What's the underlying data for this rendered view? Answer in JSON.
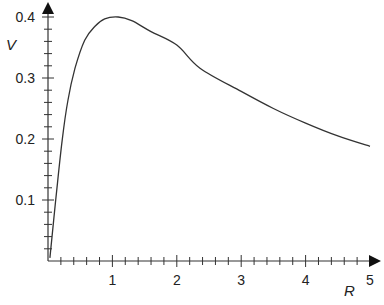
{
  "chart_data": {
    "type": "line",
    "title": "",
    "xlabel": "R",
    "ylabel": "V",
    "xlim": [
      0,
      5
    ],
    "ylim": [
      0,
      0.4
    ],
    "grid": false,
    "legend": null,
    "x_ticks": [
      1,
      2,
      3,
      4,
      5
    ],
    "x_tick_labels": [
      "1",
      "2",
      "3",
      "4",
      "5"
    ],
    "x_minor_step": 0.2,
    "y_ticks": [
      0.1,
      0.2,
      0.3,
      0.4
    ],
    "y_tick_labels": [
      "0.1",
      "0.2",
      "0.3",
      "0.4"
    ],
    "y_minor_step": 0.02,
    "series": [
      {
        "name": "V(R)",
        "color": "#333333",
        "x": [
          0.03,
          0.12,
          0.22,
          0.31,
          0.42,
          0.57,
          0.73,
          0.88,
          1.09,
          1.3,
          1.6,
          2.0,
          2.36,
          3.0,
          3.5,
          4.0,
          4.5,
          5.0
        ],
        "y": [
          0.005,
          0.1,
          0.198,
          0.264,
          0.316,
          0.362,
          0.385,
          0.397,
          0.4,
          0.394,
          0.376,
          0.354,
          0.316,
          0.278,
          0.25,
          0.226,
          0.205,
          0.188
        ]
      }
    ]
  }
}
